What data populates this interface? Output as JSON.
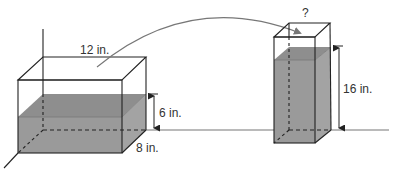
{
  "colors": {
    "edge": "#222222",
    "water_front": "#9a9a9a",
    "water_top": "#8e8e8e",
    "water_side": "#a3a3a3",
    "arrow": "#777777",
    "ground": "#777777",
    "label": "#333333"
  },
  "left_container": {
    "length_label": "12 in.",
    "width_label": "8 in.",
    "water_height_label": "6 in."
  },
  "right_container": {
    "base_label": "?",
    "water_height_label": "16 in."
  },
  "transfer_arrow": {
    "icon": "curved-arrow-icon"
  }
}
